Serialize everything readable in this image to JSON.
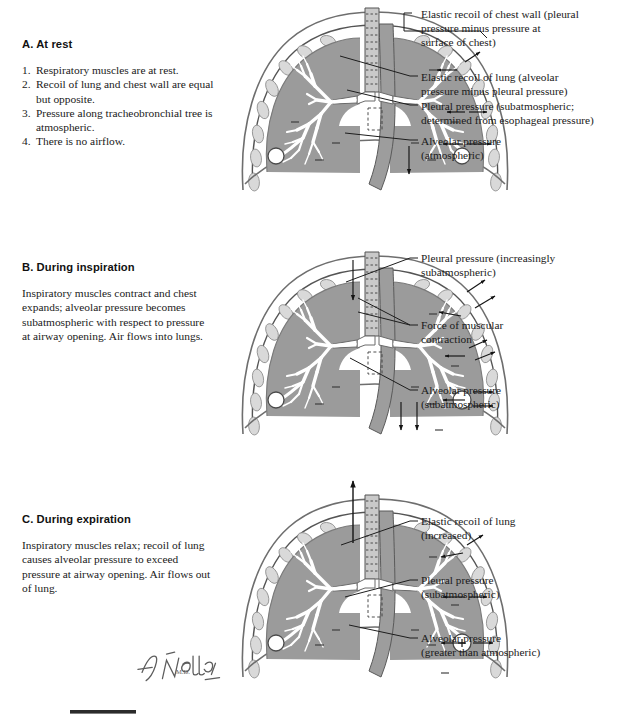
{
  "plate": {
    "signature": "F. Netter",
    "signature_suffix": "M.D."
  },
  "panels": [
    {
      "id": "at-rest",
      "heading": "A. At rest",
      "list": [
        {
          "num": "1.",
          "text": "Respiratory muscles are at rest."
        },
        {
          "num": "2.",
          "text": "Recoil of lung and chest wall are equal but opposite."
        },
        {
          "num": "3.",
          "text": "Pressure along tracheobronchial tree is atmospheric."
        },
        {
          "num": "4.",
          "text": "There is no airflow."
        }
      ],
      "callouts": [
        {
          "id": "elastic-recoil-chest-wall",
          "line1": "Elastic recoil of chest wall (pleural",
          "line2": "pressure minus pressure at",
          "line3": "surface of chest)"
        },
        {
          "id": "elastic-recoil-lung",
          "line1": "Elastic recoil of lung (alveolar",
          "line2": "pressure minus pleural pressure)"
        },
        {
          "id": "pleural-pressure",
          "line1": "Pleural pressure (subatmospheric;",
          "line2": "determined from esophageal pressure)"
        },
        {
          "id": "alveolar-pressure",
          "line1": "Alveolar pressure",
          "line2": "(atmospheric)"
        }
      ]
    },
    {
      "id": "during-inspiration",
      "heading": "B. During inspiration",
      "body": "Inspiratory muscles contract and chest expands; alveolar pressure becomes subatmospheric with respect to pressure at airway opening. Air flows into lungs.",
      "callouts": [
        {
          "id": "pleural-pressure-increasingly-sub",
          "line1": "Pleural pressure (increasingly",
          "line2": "subatmospheric)"
        },
        {
          "id": "force-of-muscular-contraction",
          "line1": "Force of muscular",
          "line2": "contraction"
        },
        {
          "id": "alveolar-pressure-sub",
          "line1": "Alveolar pressure",
          "line2": "(subatmospheric)"
        }
      ]
    },
    {
      "id": "during-expiration",
      "heading": "C. During expiration",
      "body": "Inspiratory muscles relax; recoil of lung causes alveolar pressure to exceed pressure at airway opening. Air flows out of lung.",
      "callouts": [
        {
          "id": "elastic-recoil-lung-increased",
          "line1": "Elastic recoil of lung",
          "line2": "(increased)"
        },
        {
          "id": "pleural-pressure-sub",
          "line1": "Pleural pressure",
          "line2": "(subatmospheric)"
        },
        {
          "id": "alveolar-pressure-greater",
          "line1": "Alveolar pressure",
          "line2": "(greater than atmospheric)"
        }
      ]
    }
  ],
  "symbols": {
    "alveolus_rest": "",
    "alveolus_expiration": "+"
  },
  "colors": {
    "lung_fill": "#9b9b9b",
    "rib_fill": "#d9d9d9",
    "ink": "#141414",
    "outline": "#6e6e6e"
  }
}
